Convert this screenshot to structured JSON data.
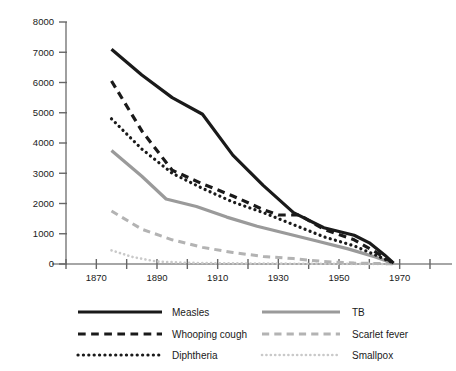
{
  "chart_data": {
    "type": "line",
    "title": "",
    "subtitle": "",
    "xlabel": "",
    "ylabel": "",
    "xlim": [
      1860,
      1980
    ],
    "ylim": [
      0,
      8000
    ],
    "grid": false,
    "legend_position": "bottom",
    "x_ticks": [
      1860,
      1870,
      1880,
      1890,
      1900,
      1910,
      1920,
      1930,
      1940,
      1950,
      1960,
      1970,
      1980
    ],
    "x_tick_labels": [
      "",
      "1870",
      "",
      "1890",
      "",
      "1910",
      "",
      "1930",
      "",
      "1950",
      "",
      "1970",
      ""
    ],
    "y_ticks": [
      0,
      1000,
      2000,
      3000,
      4000,
      5000,
      6000,
      7000,
      8000
    ],
    "y_tick_labels": [
      "0",
      "1000",
      "2000",
      "3000",
      "4000",
      "5000",
      "6000",
      "7000",
      "8000"
    ],
    "series": [
      {
        "name": "Measles",
        "style": "solid",
        "color": "#1a1a1a",
        "width": 3.2,
        "x": [
          1875,
          1885,
          1895,
          1905,
          1915,
          1925,
          1935,
          1945,
          1955,
          1960,
          1965,
          1968
        ],
        "values": [
          7100,
          6250,
          5500,
          4950,
          3600,
          2600,
          1700,
          1200,
          950,
          700,
          300,
          30
        ]
      },
      {
        "name": "Whooping cough",
        "style": "dashed",
        "color": "#1a1a1a",
        "width": 3.2,
        "x": [
          1875,
          1885,
          1895,
          1905,
          1915,
          1925,
          1930,
          1937,
          1945,
          1955,
          1962,
          1968
        ],
        "values": [
          6050,
          4400,
          3100,
          2650,
          2250,
          1800,
          1620,
          1620,
          1150,
          800,
          400,
          30
        ]
      },
      {
        "name": "Diphtheria",
        "style": "dotted",
        "color": "#1a1a1a",
        "width": 3.2,
        "x": [
          1875,
          1885,
          1895,
          1905,
          1915,
          1925,
          1935,
          1945,
          1955,
          1962,
          1968
        ],
        "values": [
          4800,
          3800,
          3000,
          2500,
          2050,
          1700,
          1300,
          900,
          600,
          300,
          30
        ]
      },
      {
        "name": "TB",
        "style": "solid",
        "color": "#9a9a9a",
        "width": 3.2,
        "x": [
          1875,
          1885,
          1893,
          1903,
          1913,
          1923,
          1933,
          1943,
          1953,
          1962,
          1968
        ],
        "values": [
          3750,
          2900,
          2150,
          1900,
          1550,
          1250,
          1000,
          750,
          500,
          230,
          20
        ]
      },
      {
        "name": "Scarlet fever",
        "style": "dashed",
        "color": "#b3b3b3",
        "width": 3.0,
        "x": [
          1875,
          1885,
          1895,
          1905,
          1915,
          1925,
          1935,
          1945,
          1955,
          1965,
          1968
        ],
        "values": [
          1750,
          1150,
          800,
          550,
          380,
          250,
          180,
          80,
          30,
          10,
          5
        ]
      },
      {
        "name": "Smallpox",
        "style": "dotted",
        "color": "#c9c9c9",
        "width": 2.6,
        "x": [
          1875,
          1882,
          1890,
          1900,
          1910,
          1920,
          1930,
          1940,
          1950,
          1960,
          1968
        ],
        "values": [
          450,
          230,
          80,
          40,
          25,
          18,
          12,
          8,
          5,
          3,
          2
        ]
      }
    ]
  },
  "legend": {
    "entries": [
      {
        "label": "Measles",
        "style": "solid",
        "color": "#1a1a1a",
        "column": 0,
        "row": 0
      },
      {
        "label": "Whooping cough",
        "style": "dashed",
        "color": "#1a1a1a",
        "column": 0,
        "row": 1
      },
      {
        "label": "Diphtheria",
        "style": "dotted",
        "color": "#1a1a1a",
        "column": 0,
        "row": 2
      },
      {
        "label": "TB",
        "style": "solid",
        "color": "#9a9a9a",
        "column": 1,
        "row": 0
      },
      {
        "label": "Scarlet fever",
        "style": "dashed",
        "color": "#b3b3b3",
        "column": 1,
        "row": 1
      },
      {
        "label": "Smallpox",
        "style": "dotted",
        "color": "#c9c9c9",
        "column": 1,
        "row": 2
      }
    ]
  },
  "axis": {
    "line_color": "#888888",
    "tick_color": "#666666"
  }
}
